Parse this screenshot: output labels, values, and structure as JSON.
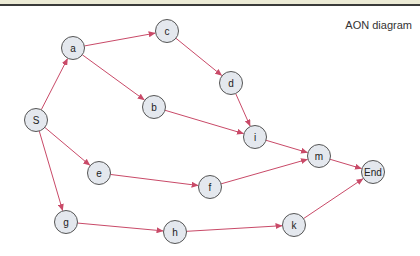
{
  "title": "AON diagram",
  "colors": {
    "edge": "#c94a68",
    "node_fill": "#e4e8ee",
    "node_stroke": "#555555",
    "band": "#ecebd6",
    "rule": "#3a3a3a"
  },
  "nodes": [
    {
      "id": "S",
      "label": "S",
      "x": 36,
      "y": 120
    },
    {
      "id": "a",
      "label": "a",
      "x": 73,
      "y": 48
    },
    {
      "id": "b",
      "label": "b",
      "x": 154,
      "y": 107
    },
    {
      "id": "c",
      "label": "c",
      "x": 167,
      "y": 31
    },
    {
      "id": "d",
      "label": "d",
      "x": 231,
      "y": 83
    },
    {
      "id": "e",
      "label": "e",
      "x": 99,
      "y": 173
    },
    {
      "id": "f",
      "label": "f",
      "x": 210,
      "y": 187
    },
    {
      "id": "g",
      "label": "g",
      "x": 66,
      "y": 222
    },
    {
      "id": "h",
      "label": "h",
      "x": 175,
      "y": 232
    },
    {
      "id": "i",
      "label": "i",
      "x": 255,
      "y": 137
    },
    {
      "id": "k",
      "label": "k",
      "x": 294,
      "y": 225
    },
    {
      "id": "m",
      "label": "m",
      "x": 319,
      "y": 156
    },
    {
      "id": "End",
      "label": "End",
      "x": 373,
      "y": 172
    }
  ],
  "edges": [
    [
      "S",
      "a"
    ],
    [
      "S",
      "e"
    ],
    [
      "S",
      "g"
    ],
    [
      "a",
      "c"
    ],
    [
      "a",
      "b"
    ],
    [
      "c",
      "d"
    ],
    [
      "d",
      "i"
    ],
    [
      "b",
      "i"
    ],
    [
      "i",
      "m"
    ],
    [
      "e",
      "f"
    ],
    [
      "f",
      "m"
    ],
    [
      "m",
      "End"
    ],
    [
      "g",
      "h"
    ],
    [
      "h",
      "k"
    ],
    [
      "k",
      "End"
    ]
  ]
}
